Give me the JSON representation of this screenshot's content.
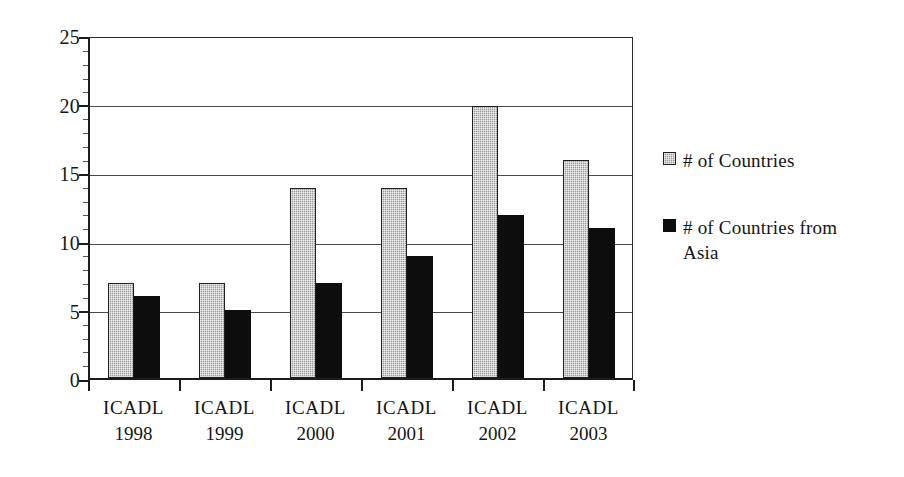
{
  "chart_data": {
    "type": "bar",
    "title": "",
    "subtitle": "",
    "xlabel": "",
    "ylabel": "",
    "categories": [
      "ICADL 1998",
      "ICADL 1999",
      "ICADL 2000",
      "ICADL 2001",
      "ICADL 2002",
      "ICADL 2003"
    ],
    "category_lines": [
      {
        "line1": "ICADL",
        "line2": "1998"
      },
      {
        "line1": "ICADL",
        "line2": "1999"
      },
      {
        "line1": "ICADL",
        "line2": "2000"
      },
      {
        "line1": "ICADL",
        "line2": "2001"
      },
      {
        "line1": "ICADL",
        "line2": "2002"
      },
      {
        "line1": "ICADL",
        "line2": "2003"
      }
    ],
    "series": [
      {
        "name": "# of Countries",
        "color": "#9a9a9a",
        "values": [
          7,
          7,
          14,
          14,
          20,
          16
        ]
      },
      {
        "name": "# of Countries from Asia",
        "color": "#0d0d0d",
        "values": [
          6,
          5,
          7,
          9,
          12,
          11
        ]
      }
    ],
    "ylim": [
      0,
      25
    ],
    "ytick_values": [
      0,
      5,
      10,
      15,
      20,
      25
    ],
    "ytick_labels": [
      "0",
      "5",
      "10",
      "15",
      "20",
      "25"
    ],
    "grid": true,
    "grid_axis": "y",
    "legend_position": "right",
    "legend": [
      {
        "label": "# of Countries",
        "lines": [
          "# of Countries"
        ],
        "swatch": "gray"
      },
      {
        "label": "# of Countries from Asia",
        "lines": [
          "# of Countries from",
          "Asia"
        ],
        "swatch": "black"
      }
    ]
  }
}
